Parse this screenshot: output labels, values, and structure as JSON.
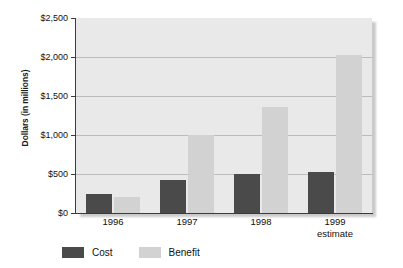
{
  "chart_data": {
    "type": "bar",
    "title": "",
    "xlabel": "",
    "ylabel": "Dollars (in millions)",
    "ylim": [
      0,
      2500
    ],
    "ytick_values": [
      0,
      500,
      1000,
      1500,
      2000,
      2500
    ],
    "ytick_labels": [
      "$0",
      "$500",
      "$1,000",
      "$1,500",
      "$2,000",
      "$2,500"
    ],
    "grid": true,
    "legend_position": "bottom-left",
    "categories": [
      "1996",
      "1997",
      "1998",
      "1999"
    ],
    "category_sublabels": [
      "",
      "",
      "",
      "estimate"
    ],
    "series": [
      {
        "name": "Cost",
        "values": [
          250,
          420,
          500,
          520
        ],
        "color": "#4a4a4a"
      },
      {
        "name": "Benefit",
        "values": [
          200,
          1000,
          1360,
          2030
        ],
        "color": "#d2d2d2"
      }
    ]
  },
  "legend": {
    "items": [
      {
        "label": "Cost",
        "swatch": "cost-swatch"
      },
      {
        "label": "Benefit",
        "swatch": "benefit-swatch"
      }
    ]
  },
  "colors": {
    "cost": "#4a4a4a",
    "benefit": "#d2d2d2",
    "plot_background": "#e9e9e9",
    "gridline": "#bcbcbc",
    "axis": "#3c3c3c",
    "text": "#111111",
    "page_background": "#ffffff"
  }
}
